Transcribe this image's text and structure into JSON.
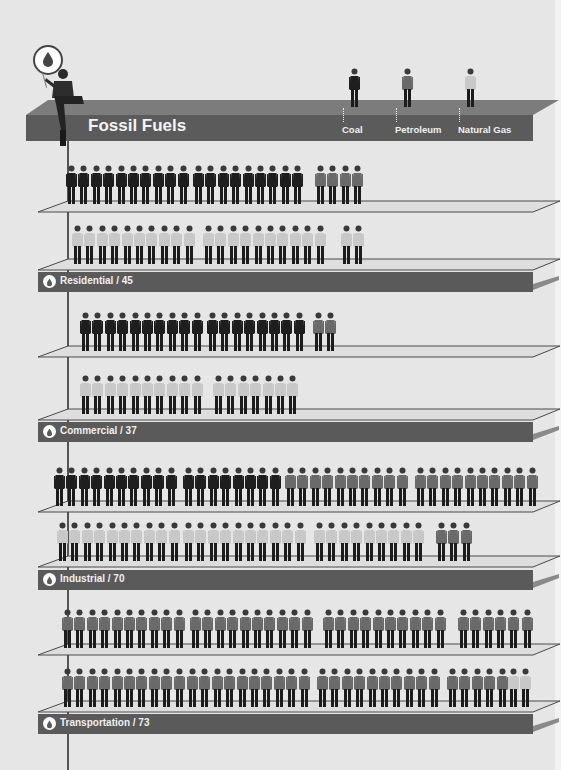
{
  "header": {
    "title": "Fossil Fuels",
    "sources": [
      {
        "label": "Coal",
        "color": "#1e1e1e"
      },
      {
        "label": "Petroleum",
        "color": "#6a6a6a"
      },
      {
        "label": "Natural Gas",
        "color": "#c8c8c8"
      }
    ],
    "icon": "oil-drop-icon"
  },
  "colors": {
    "background": "#e6e6e6",
    "bar_front": "#5a5a5a",
    "bar_top": "#7c7c7c",
    "shelf": "#d9d9d9",
    "coal": "#1e1e1e",
    "petroleum": "#6a6a6a",
    "natural_gas": "#c8c8c8"
  },
  "sectors": [
    {
      "label": "Residential / 45",
      "name": "Residential",
      "total": 45,
      "rows": [
        {
          "y": 165,
          "groups": [
            {
              "type": "coal",
              "count": 10,
              "x": 66
            },
            {
              "type": "coal",
              "count": 9,
              "x": 193
            },
            {
              "type": "petroleum",
              "count": 4,
              "x": 315
            }
          ]
        },
        {
          "y": 225,
          "groups": [
            {
              "type": "natural_gas",
              "count": 10,
              "x": 72
            },
            {
              "type": "natural_gas",
              "count": 10,
              "x": 203
            },
            {
              "type": "natural_gas",
              "count": 2,
              "x": 341
            }
          ]
        }
      ],
      "shelf_y": [
        200,
        258
      ],
      "bar_y": 272
    },
    {
      "label": "Commercial / 37",
      "name": "Commercial",
      "total": 37,
      "rows": [
        {
          "y": 312,
          "groups": [
            {
              "type": "coal",
              "count": 10,
              "x": 80
            },
            {
              "type": "coal",
              "count": 8,
              "x": 207
            },
            {
              "type": "petroleum",
              "count": 2,
              "x": 313
            }
          ]
        },
        {
          "y": 375,
          "groups": [
            {
              "type": "natural_gas",
              "count": 10,
              "x": 80
            },
            {
              "type": "natural_gas",
              "count": 7,
              "x": 213
            }
          ]
        }
      ],
      "shelf_y": [
        345,
        408
      ],
      "bar_y": 422
    },
    {
      "label": "Industrial / 70",
      "name": "Industrial",
      "total": 70,
      "rows": [
        {
          "y": 467,
          "groups": [
            {
              "type": "coal",
              "count": 10,
              "x": 54
            },
            {
              "type": "coal",
              "count": 8,
              "x": 183
            },
            {
              "type": "petroleum",
              "count": 10,
              "x": 285
            },
            {
              "type": "petroleum",
              "count": 10,
              "x": 415
            }
          ]
        },
        {
          "y": 522,
          "groups": [
            {
              "type": "natural_gas",
              "count": 10,
              "x": 57
            },
            {
              "type": "natural_gas",
              "count": 10,
              "x": 183
            },
            {
              "type": "natural_gas",
              "count": 9,
              "x": 314
            },
            {
              "type": "petroleum",
              "count": 3,
              "x": 436
            }
          ]
        }
      ],
      "shelf_y": [
        500,
        555
      ],
      "bar_y": 570
    },
    {
      "label": "Transportation / 73",
      "name": "Transportation",
      "total": 73,
      "rows": [
        {
          "y": 609,
          "groups": [
            {
              "type": "petroleum",
              "count": 10,
              "x": 62
            },
            {
              "type": "petroleum",
              "count": 10,
              "x": 190
            },
            {
              "type": "petroleum",
              "count": 10,
              "x": 323
            },
            {
              "type": "petroleum",
              "count": 5,
              "x": 458
            },
            {
              "type": "petroleum",
              "count": 1,
              "x": 522
            }
          ]
        },
        {
          "y": 668,
          "groups": [
            {
              "type": "petroleum",
              "count": 10,
              "x": 62
            },
            {
              "type": "petroleum",
              "count": 10,
              "x": 187
            },
            {
              "type": "petroleum",
              "count": 10,
              "x": 317
            },
            {
              "type": "petroleum",
              "count": 5,
              "x": 447
            },
            {
              "type": "natural_gas",
              "count": 2,
              "x": 508
            }
          ]
        }
      ],
      "shelf_y": [
        643,
        700
      ],
      "bar_y": 714
    }
  ],
  "chart_data": {
    "type": "bar",
    "title": "Fossil Fuels",
    "categories": [
      "Residential",
      "Commercial",
      "Industrial",
      "Transportation"
    ],
    "series": [
      {
        "name": "Coal",
        "values": [
          19,
          18,
          18,
          0
        ]
      },
      {
        "name": "Petroleum",
        "values": [
          4,
          2,
          23,
          71
        ]
      },
      {
        "name": "Natural Gas",
        "values": [
          22,
          17,
          29,
          2
        ]
      }
    ],
    "totals": [
      45,
      37,
      70,
      73
    ],
    "xlabel": "",
    "ylabel": "",
    "legend": [
      "Coal",
      "Petroleum",
      "Natural Gas"
    ],
    "encoding": "isotype pictogram (one figure per unit)"
  }
}
